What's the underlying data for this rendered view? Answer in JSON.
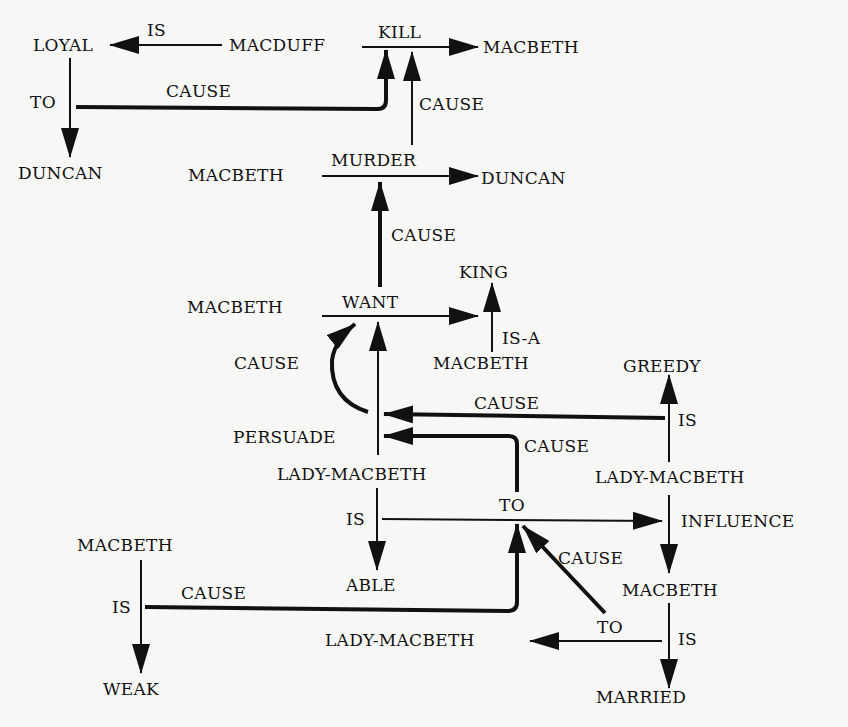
{
  "diagram": {
    "type": "semantic-network",
    "nodes": {
      "loyal": "LOYAL",
      "macduff": "MACDUFF",
      "macbeth_top": "MACBETH",
      "duncan_left": "DUNCAN",
      "macbeth_murder": "MACBETH",
      "duncan_murder": "DUNCAN",
      "king": "KING",
      "macbeth_want": "MACBETH",
      "macbeth_isa": "MACBETH",
      "greedy": "GREEDY",
      "persuade": "PERSUADE",
      "lady_macbeth_persuade": "LADY-MACBETH",
      "lady_macbeth_greedy": "LADY-MACBETH",
      "able": "ABLE",
      "influence": "INFLUENCE",
      "macbeth_weak": "MACBETH",
      "weak": "WEAK",
      "macbeth_married": "MACBETH",
      "lady_macbeth_to": "LADY-MACBETH",
      "married": "MARRIED"
    },
    "edge_labels": {
      "is_loyal": "IS",
      "kill": "KILL",
      "to_duncan": "TO",
      "cause_loyal_kill": "CAUSE",
      "cause_murder_kill": "CAUSE",
      "murder": "MURDER",
      "cause_want_murder": "CAUSE",
      "want": "WANT",
      "is_a": "IS-A",
      "cause_persuade_want": "CAUSE",
      "cause_greedy_persuade": "CAUSE",
      "cause_to_persuade": "CAUSE",
      "is_greedy": "IS",
      "is_able": "IS",
      "to_influence": "TO",
      "cause_married_to": "CAUSE",
      "is_weak": "IS",
      "cause_weak_to": "CAUSE",
      "to_lady": "TO",
      "is_married": "IS"
    },
    "colors": {
      "ink": "#111111",
      "background": "#f7f7f5"
    }
  }
}
